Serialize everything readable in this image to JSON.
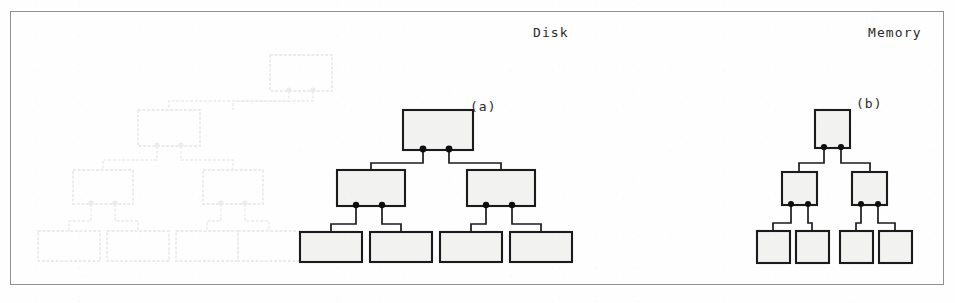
{
  "figure": {
    "kind": "scanned-textbook-illustration",
    "width": 955,
    "height": 303,
    "frame": {
      "border_color": "#8e9094",
      "background_color": "#fefefe"
    },
    "ink_color": "#1b1b1b",
    "node_fill_color": "#f2f2f0",
    "dot_color": "#0d0d0d",
    "ghost_color": "#3a3a3a"
  },
  "labels": {
    "disk": "Disk",
    "memory": "Memory",
    "part_a": "(a)",
    "part_b": "(b)"
  },
  "trees": {
    "disk_tree": {
      "caption": "(a)",
      "region": "Disk",
      "levels": 3,
      "branching_factor": 2,
      "node_counts": [
        1,
        2,
        4
      ],
      "total_nodes": 7,
      "node_size": {
        "width": 70,
        "height": 40
      },
      "leaf_size": {
        "width": 62,
        "height": 30
      },
      "pointers_per_node": 2,
      "nodes": [
        {
          "id": "a-root",
          "level": 0,
          "x": 403,
          "y": 110,
          "w": 70,
          "h": 40,
          "dots": [
            423,
            449
          ]
        },
        {
          "id": "a-mid-l",
          "level": 1,
          "x": 337,
          "y": 170,
          "w": 68,
          "h": 36,
          "dots": [
            356,
            382
          ]
        },
        {
          "id": "a-mid-r",
          "level": 1,
          "x": 467,
          "y": 170,
          "w": 68,
          "h": 36,
          "dots": [
            486,
            512
          ]
        },
        {
          "id": "a-leaf-1",
          "level": 2,
          "x": 300,
          "y": 232,
          "w": 62,
          "h": 30
        },
        {
          "id": "a-leaf-2",
          "level": 2,
          "x": 370,
          "y": 232,
          "w": 62,
          "h": 30
        },
        {
          "id": "a-leaf-3",
          "level": 2,
          "x": 440,
          "y": 232,
          "w": 62,
          "h": 30
        },
        {
          "id": "a-leaf-4",
          "level": 2,
          "x": 510,
          "y": 232,
          "w": 62,
          "h": 30
        }
      ],
      "edges": [
        {
          "from": "a-root",
          "to": "a-mid-l"
        },
        {
          "from": "a-root",
          "to": "a-mid-r"
        },
        {
          "from": "a-mid-l",
          "to": "a-leaf-1"
        },
        {
          "from": "a-mid-l",
          "to": "a-leaf-2"
        },
        {
          "from": "a-mid-r",
          "to": "a-leaf-3"
        },
        {
          "from": "a-mid-r",
          "to": "a-leaf-4"
        }
      ]
    },
    "memory_tree": {
      "caption": "(b)",
      "region": "Memory",
      "levels": 3,
      "branching_factor": 2,
      "node_counts": [
        1,
        2,
        4
      ],
      "total_nodes": 7,
      "node_size": {
        "width": 35,
        "height": 38
      },
      "leaf_size": {
        "width": 33,
        "height": 32
      },
      "pointers_per_node": 2,
      "nodes": [
        {
          "id": "b-root",
          "level": 0,
          "x": 815,
          "y": 110,
          "w": 35,
          "h": 38,
          "dots": [
            824,
            841
          ]
        },
        {
          "id": "b-mid-l",
          "level": 1,
          "x": 782,
          "y": 172,
          "w": 35,
          "h": 33,
          "dots": [
            791,
            808
          ]
        },
        {
          "id": "b-mid-r",
          "level": 1,
          "x": 852,
          "y": 172,
          "w": 35,
          "h": 33,
          "dots": [
            861,
            878
          ]
        },
        {
          "id": "b-leaf-1",
          "level": 2,
          "x": 757,
          "y": 231,
          "w": 33,
          "h": 32
        },
        {
          "id": "b-leaf-2",
          "level": 2,
          "x": 796,
          "y": 231,
          "w": 33,
          "h": 32
        },
        {
          "id": "b-leaf-3",
          "level": 2,
          "x": 840,
          "y": 231,
          "w": 33,
          "h": 32
        },
        {
          "id": "b-leaf-4",
          "level": 2,
          "x": 879,
          "y": 231,
          "w": 33,
          "h": 32
        }
      ],
      "edges": [
        {
          "from": "b-root",
          "to": "b-mid-l"
        },
        {
          "from": "b-root",
          "to": "b-mid-r"
        },
        {
          "from": "b-mid-l",
          "to": "b-leaf-1"
        },
        {
          "from": "b-mid-l",
          "to": "b-leaf-2"
        },
        {
          "from": "b-mid-r",
          "to": "b-leaf-3"
        },
        {
          "from": "b-mid-r",
          "to": "b-leaf-4"
        }
      ]
    },
    "ghost_tree": {
      "description": "faint offset-print bleed-through duplicate of the disk tree",
      "visible": true,
      "opacity": 0.085,
      "levels": 3,
      "node_counts": [
        1,
        2,
        4
      ],
      "total_nodes": 7,
      "nodes": [
        {
          "id": "g-root",
          "level": 0,
          "x": 270,
          "y": 55,
          "w": 62,
          "h": 36,
          "dots": [
            289,
            313
          ]
        },
        {
          "id": "g-mid-l",
          "level": 1,
          "x": 138,
          "y": 110,
          "w": 62,
          "h": 36,
          "dots": [
            157,
            181
          ]
        },
        {
          "id": "g-mid-r",
          "level": 1,
          "x": 203,
          "y": 170,
          "w": 60,
          "h": 34,
          "dots": [
            221,
            245
          ]
        },
        {
          "id": "g-mid-ll",
          "level": 1,
          "x": 73,
          "y": 170,
          "w": 60,
          "h": 34,
          "dots": [
            91,
            115
          ]
        },
        {
          "id": "g-leaf-1",
          "level": 2,
          "x": 38,
          "y": 231,
          "w": 62,
          "h": 30
        },
        {
          "id": "g-leaf-2",
          "level": 2,
          "x": 107,
          "y": 231,
          "w": 62,
          "h": 30
        },
        {
          "id": "g-leaf-3",
          "level": 2,
          "x": 176,
          "y": 231,
          "w": 62,
          "h": 30
        },
        {
          "id": "g-leaf-4",
          "level": 2,
          "x": 238,
          "y": 231,
          "w": 62,
          "h": 30
        }
      ]
    }
  }
}
